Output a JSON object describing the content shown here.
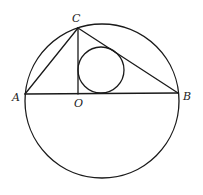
{
  "diagram": {
    "type": "geometry",
    "stroke_color": "#1a1a1a",
    "background": "#ffffff",
    "points": {
      "A": {
        "label": "A",
        "x": 25,
        "y": 94
      },
      "B": {
        "label": "B",
        "x": 178,
        "y": 93
      },
      "C": {
        "label": "C",
        "x": 78,
        "y": 28
      },
      "O": {
        "label": "O",
        "x": 78,
        "y": 94
      }
    },
    "segments": [
      {
        "name": "AB",
        "from": "A",
        "to": "B"
      },
      {
        "name": "AC",
        "from": "A",
        "to": "C"
      },
      {
        "name": "BC",
        "from": "B",
        "to": "C"
      },
      {
        "name": "CO",
        "from": "C",
        "to": "O"
      }
    ],
    "circles": [
      {
        "name": "circumcircle",
        "cx": 102,
        "cy": 101,
        "r": 77
      },
      {
        "name": "incircle-COB",
        "cx": 101,
        "cy": 70,
        "r": 23
      }
    ],
    "labels": {
      "A": "A",
      "B": "B",
      "C": "C",
      "O": "O"
    }
  }
}
